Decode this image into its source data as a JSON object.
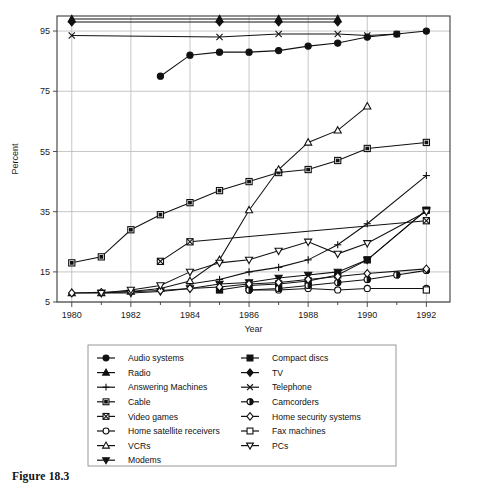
{
  "figure": {
    "caption": "Figure 18.3"
  },
  "chart_data": {
    "type": "line",
    "title": "",
    "xlabel": "Year",
    "ylabel": "Percent",
    "xlim": [
      1979.5,
      1992.8
    ],
    "ylim": [
      5,
      100
    ],
    "xticks": [
      1980,
      1982,
      1984,
      1986,
      1988,
      1990,
      1992
    ],
    "xtick_labels": [
      "1980",
      "1982",
      "1984",
      "1986",
      "1988",
      "1990",
      "1992"
    ],
    "x_minor_ticks": [
      1981,
      1983,
      1985,
      1987,
      1989,
      1991
    ],
    "yticks": [
      5,
      15,
      35,
      55,
      75,
      95
    ],
    "ytick_labels": [
      "5",
      "15",
      "35",
      "55",
      "75",
      "95"
    ],
    "grid": true,
    "legend_position": "below-plot",
    "series": [
      {
        "name": "Audio systems",
        "marker": "filled-circle",
        "x": [
          1983,
          1984,
          1985,
          1986,
          1987,
          1988,
          1989,
          1990,
          1991,
          1992
        ],
        "values": [
          80,
          87,
          88,
          88,
          88.5,
          90,
          91,
          93,
          94,
          95
        ]
      },
      {
        "name": "Radio",
        "marker": "filled-triangle-up",
        "x": [
          1980,
          1985,
          1987,
          1989
        ],
        "values": [
          99,
          99,
          99,
          99
        ]
      },
      {
        "name": "Answering Machines",
        "marker": "plus",
        "x": [
          1984,
          1985,
          1986,
          1987,
          1988,
          1989,
          1990,
          1992
        ],
        "values": [
          11,
          12.5,
          15,
          16.5,
          19,
          24,
          31,
          47
        ]
      },
      {
        "name": "Cable",
        "marker": "open-square",
        "x": [
          1980,
          1981,
          1982,
          1983,
          1984,
          1985,
          1986,
          1987,
          1988,
          1989,
          1990,
          1992
        ],
        "values": [
          18,
          20,
          29,
          34,
          38,
          42,
          45,
          48,
          49,
          52,
          56,
          58
        ]
      },
      {
        "name": "Video games",
        "marker": "crossed-square",
        "x": [
          1983,
          1984,
          1992
        ],
        "values": [
          18.5,
          25,
          32
        ]
      },
      {
        "name": "Home satellite receivers",
        "marker": "open-circle",
        "x": [
          1986,
          1987,
          1988,
          1989,
          1990,
          1992
        ],
        "values": [
          9,
          9,
          9.5,
          9,
          9.5,
          9.5
        ]
      },
      {
        "name": "VCRs",
        "marker": "open-triangle-up",
        "x": [
          1980,
          1981,
          1982,
          1983,
          1984,
          1985,
          1986,
          1987,
          1988,
          1989,
          1990
        ],
        "values": [
          8,
          8,
          8.5,
          9.5,
          12,
          19,
          35.5,
          49,
          58,
          62,
          70
        ]
      },
      {
        "name": "Modems",
        "marker": "filled-triangle-down",
        "x": [
          1981,
          1982,
          1983,
          1984,
          1985,
          1986,
          1987,
          1988,
          1989,
          1990,
          1992
        ],
        "values": [
          8,
          8,
          8.5,
          9.5,
          11,
          11.5,
          13,
          14,
          15,
          19,
          35.5
        ]
      },
      {
        "name": "Compact discs",
        "marker": "filled-square",
        "x": [
          1985,
          1986,
          1987,
          1988,
          1989,
          1990,
          1992
        ],
        "values": [
          9,
          10.5,
          11,
          12,
          14,
          19,
          35.5
        ]
      },
      {
        "name": "TV",
        "marker": "filled-diamond",
        "x": [
          1980,
          1985,
          1987,
          1989
        ],
        "values": [
          98,
          98,
          98,
          98
        ]
      },
      {
        "name": "Telephone",
        "marker": "x-cross",
        "x": [
          1980,
          1985,
          1987,
          1989,
          1990,
          1991
        ],
        "values": [
          93.5,
          93,
          94,
          94,
          93.5,
          94
        ]
      },
      {
        "name": "Camcorders",
        "marker": "half-circle",
        "x": [
          1986,
          1987,
          1988,
          1989,
          1990,
          1991,
          1992
        ],
        "values": [
          9,
          9.5,
          10.5,
          11.5,
          12.5,
          14,
          15.5
        ]
      },
      {
        "name": "Home security systems",
        "marker": "open-diamond",
        "x": [
          1980,
          1981,
          1982,
          1983,
          1984,
          1985,
          1986,
          1987,
          1988,
          1989,
          1990,
          1992
        ],
        "values": [
          8,
          8.2,
          8.4,
          8.8,
          9.5,
          10,
          11,
          11.5,
          12.5,
          13.5,
          14.5,
          16
        ]
      },
      {
        "name": "Fax machines",
        "marker": "open-square-small",
        "x": [
          1992
        ],
        "values": [
          9
        ]
      },
      {
        "name": "PCs",
        "marker": "open-triangle-down",
        "x": [
          1981,
          1982,
          1983,
          1984,
          1985,
          1986,
          1987,
          1988,
          1989,
          1990,
          1992
        ],
        "values": [
          8,
          9,
          10.5,
          15,
          18,
          19,
          22,
          25,
          21,
          24.5,
          35
        ]
      }
    ]
  },
  "legend": {
    "column_left": [
      {
        "label": "Audio systems",
        "marker": "filled-circle"
      },
      {
        "label": "Radio",
        "marker": "filled-triangle-up"
      },
      {
        "label": "Answering Machines",
        "marker": "plus"
      },
      {
        "label": "Cable",
        "marker": "open-square"
      },
      {
        "label": "Video games",
        "marker": "crossed-square"
      },
      {
        "label": "Home satellite receivers",
        "marker": "open-circle"
      },
      {
        "label": "VCRs",
        "marker": "open-triangle-up"
      },
      {
        "label": "Modems",
        "marker": "filled-triangle-down"
      }
    ],
    "column_right": [
      {
        "label": "Compact discs",
        "marker": "filled-square"
      },
      {
        "label": "TV",
        "marker": "filled-diamond"
      },
      {
        "label": "Telephone",
        "marker": "x-cross"
      },
      {
        "label": "Camcorders",
        "marker": "half-circle"
      },
      {
        "label": "Home security systems",
        "marker": "open-diamond"
      },
      {
        "label": "Fax machines",
        "marker": "open-square-small"
      },
      {
        "label": "PCs",
        "marker": "open-triangle-down"
      }
    ]
  },
  "colors": {
    "ink": "#111111",
    "grid": "#b9b9b9",
    "frame": "#3c3c3c",
    "background": "#ffffff"
  }
}
